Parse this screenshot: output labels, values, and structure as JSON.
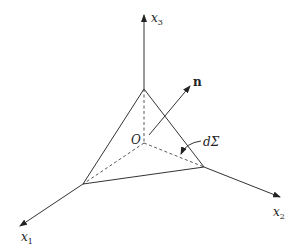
{
  "diagram": {
    "axes": [
      {
        "id": "x1",
        "label": "x",
        "subscript": "1"
      },
      {
        "id": "x2",
        "label": "x",
        "subscript": "2"
      },
      {
        "id": "x3",
        "label": "x",
        "subscript": "3"
      }
    ],
    "origin_label": "O",
    "normal_label": "n",
    "surface_label": "dΣ",
    "colors": {
      "line": "#333333",
      "background": "#ffffff"
    }
  }
}
